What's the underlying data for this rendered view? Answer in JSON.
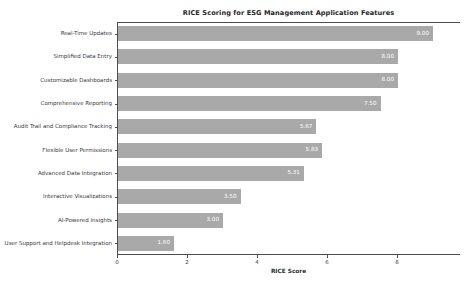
{
  "chart_data": {
    "type": "bar",
    "orientation": "horizontal",
    "title": "RICE Scoring for ESG Management Application Features",
    "xlabel": "RICE Score",
    "ylabel": "",
    "categories": [
      "Real-Time Updates",
      "Simplified Data Entry",
      "Customizable Dashboards",
      "Comprehensive Reporting",
      "Audit Trail and Compliance Tracking",
      "Flexible User Permissions",
      "Advanced Data Integration",
      "Interactive Visualizations",
      "AI-Powered Insights",
      "User Support and Helpdesk Integration"
    ],
    "values": [
      9.0,
      8.0,
      8.0,
      7.5,
      5.67,
      5.83,
      5.31,
      3.5,
      3.0,
      1.6
    ],
    "value_labels": [
      "9.00",
      "8.00",
      "8.00",
      "7.50",
      "5.67",
      "5.83",
      "5.31",
      "3.50",
      "3.00",
      "1.60"
    ],
    "xlim": [
      0,
      9.8
    ],
    "xticks": [
      0,
      2,
      4,
      6,
      8
    ],
    "xtick_labels": [
      "0",
      "2",
      "4",
      "6",
      "8"
    ],
    "grid": false,
    "legend": false,
    "bar_color": "#a9a9a9",
    "value_label_color": "#ffffff",
    "background_color": "#ffffff",
    "axis_color": "#4d4d4d"
  }
}
